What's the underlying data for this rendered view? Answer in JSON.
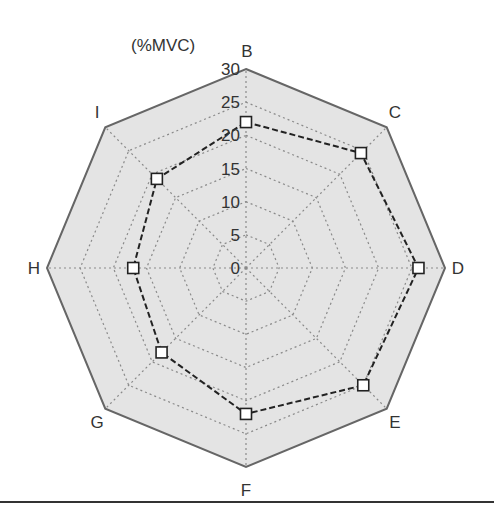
{
  "chart_data": {
    "type": "radar",
    "title": "",
    "unit_label": "(%MVC)",
    "categories": [
      "B",
      "C",
      "D",
      "E",
      "F",
      "G",
      "H",
      "I"
    ],
    "series": [
      {
        "name": "%MVC",
        "values": [
          22,
          24.5,
          26,
          25,
          22,
          18,
          17,
          19
        ],
        "line_style": "dashed",
        "marker": "open-square",
        "color": "#222222"
      }
    ],
    "radial_ticks": [
      0,
      5,
      10,
      15,
      20,
      25,
      30
    ],
    "rlim": [
      0,
      30
    ],
    "grid": true,
    "grid_style": "dotted",
    "fill_color": "#e4e4e4",
    "grid_color": "#8a8a8a",
    "border_color": "#666666"
  }
}
